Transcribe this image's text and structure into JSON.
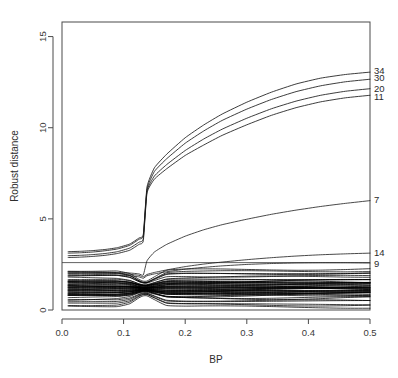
{
  "chart_data": {
    "type": "line",
    "title": "",
    "xlabel": "BP",
    "ylabel": "Robust distance",
    "xlim": [
      0.0,
      0.5
    ],
    "ylim": [
      0.0,
      15.8
    ],
    "xticks": [
      "0.0",
      "0.1",
      "0.2",
      "0.3",
      "0.4",
      "0.5"
    ],
    "xtick_values": [
      0.0,
      0.1,
      0.2,
      0.3,
      0.4,
      0.5
    ],
    "yticks": [
      "0",
      "5",
      "10",
      "15"
    ],
    "ytick_values": [
      0,
      5,
      10,
      15
    ],
    "grid": false,
    "legend": "none",
    "cutoff_line_y": 2.6,
    "breakdown_jump_x": 0.135,
    "x": [
      0.01,
      0.03,
      0.05,
      0.07,
      0.09,
      0.11,
      0.125,
      0.132,
      0.138,
      0.15,
      0.17,
      0.2,
      0.23,
      0.26,
      0.3,
      0.34,
      0.38,
      0.42,
      0.46,
      0.5
    ],
    "labelled_series": [
      {
        "name": "34",
        "label": "34",
        "values": [
          3.2,
          3.22,
          3.26,
          3.32,
          3.42,
          3.62,
          3.95,
          4.15,
          6.75,
          7.8,
          8.55,
          9.45,
          10.15,
          10.75,
          11.4,
          11.95,
          12.4,
          12.72,
          12.92,
          13.05
        ],
        "label_y": 13.15
      },
      {
        "name": "30",
        "label": "30",
        "values": [
          3.12,
          3.14,
          3.18,
          3.25,
          3.35,
          3.55,
          3.88,
          4.08,
          6.62,
          7.6,
          8.3,
          9.15,
          9.82,
          10.4,
          11.02,
          11.55,
          11.98,
          12.3,
          12.52,
          12.66
        ],
        "label_y": 12.72
      },
      {
        "name": "20",
        "label": "20",
        "values": [
          2.98,
          3.0,
          3.04,
          3.1,
          3.2,
          3.4,
          3.72,
          3.92,
          6.52,
          7.35,
          7.98,
          8.75,
          9.38,
          9.92,
          10.52,
          11.04,
          11.46,
          11.78,
          12.0,
          12.14
        ],
        "label_y": 12.12
      },
      {
        "name": "11",
        "label": "11",
        "values": [
          2.88,
          2.9,
          2.94,
          3.0,
          3.1,
          3.28,
          3.6,
          3.8,
          6.42,
          7.18,
          7.75,
          8.48,
          9.05,
          9.58,
          10.16,
          10.68,
          11.1,
          11.42,
          11.64,
          11.78
        ],
        "label_y": 11.7
      },
      {
        "name": "7",
        "label": "7",
        "values": [
          2.1,
          2.1,
          2.09,
          2.08,
          2.06,
          2.03,
          1.98,
          1.92,
          2.7,
          3.18,
          3.6,
          4.05,
          4.4,
          4.68,
          4.98,
          5.25,
          5.48,
          5.68,
          5.85,
          6.0
        ],
        "label_y": 6.02
      },
      {
        "name": "14",
        "label": "14",
        "values": [
          2.04,
          2.04,
          2.03,
          2.02,
          2.0,
          1.96,
          1.9,
          1.82,
          1.95,
          2.06,
          2.2,
          2.38,
          2.52,
          2.63,
          2.76,
          2.87,
          2.96,
          3.03,
          3.08,
          3.12
        ],
        "label_y": 3.12
      },
      {
        "name": "9",
        "label": "9",
        "values": [
          1.96,
          1.96,
          1.95,
          1.94,
          1.92,
          1.88,
          1.82,
          1.74,
          1.88,
          1.98,
          2.1,
          2.24,
          2.34,
          2.42,
          2.5,
          2.55,
          2.58,
          2.59,
          2.59,
          2.58
        ],
        "label_y": 2.52
      }
    ],
    "bulk_band": {
      "description": "dense bundle of unlabelled observation traces",
      "count": 46,
      "y_min": 0.18,
      "y_max": 2.22,
      "pinch_x": 0.135,
      "pinch_spread_factor": 0.38,
      "core_y_min": 0.75,
      "core_y_max": 1.62
    }
  }
}
